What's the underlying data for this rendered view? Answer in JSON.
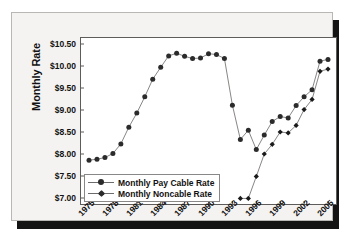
{
  "chart_data": {
    "type": "line",
    "title": "",
    "xlabel": "",
    "ylabel": "Monthly Rate",
    "xlim": [
      1975,
      2005
    ],
    "ylim": [
      7.0,
      10.5
    ],
    "ytick_labels": [
      "$10.50",
      "$10.00",
      "$9.50",
      "$9.00",
      "$8.50",
      "$8.00",
      "$7.50",
      "$7.00"
    ],
    "ytick_values": [
      10.5,
      10.0,
      9.5,
      9.0,
      8.5,
      8.0,
      7.5,
      7.0
    ],
    "xtick_labels": [
      "1975",
      "1978",
      "1981",
      "1984",
      "1987",
      "1990",
      "1993",
      "1996",
      "1999",
      "2002",
      "2005"
    ],
    "xtick_values": [
      1975,
      1978,
      1981,
      1984,
      1987,
      1990,
      1993,
      1996,
      1999,
      2002,
      2005
    ],
    "grid": false,
    "legend_position": "lower-left",
    "x": [
      1975,
      1976,
      1977,
      1978,
      1979,
      1980,
      1981,
      1982,
      1983,
      1984,
      1985,
      1986,
      1987,
      1988,
      1989,
      1990,
      1991,
      1992,
      1993,
      1994,
      1995,
      1996,
      1997,
      1998,
      1999,
      2000,
      2001,
      2002,
      2003,
      2004,
      2005
    ],
    "series": [
      {
        "name": "Monthly Pay Cable Rate",
        "marker": "circle",
        "color": "#2b2b2b",
        "x": [
          1975,
          1976,
          1977,
          1978,
          1979,
          1980,
          1981,
          1982,
          1983,
          1984,
          1985,
          1986,
          1987,
          1988,
          1989,
          1990,
          1991,
          1992,
          1993,
          1994,
          1995,
          1996,
          1997,
          1998,
          1999,
          2000,
          2001,
          2002,
          2003,
          2004,
          2005
        ],
        "values": [
          7.86,
          7.88,
          7.92,
          8.01,
          8.23,
          8.61,
          8.93,
          9.3,
          9.7,
          9.97,
          10.23,
          10.29,
          10.22,
          10.17,
          10.18,
          10.28,
          10.26,
          10.17,
          9.11,
          8.33,
          8.54,
          8.1,
          8.43,
          8.74,
          8.85,
          8.82,
          9.1,
          9.3,
          9.46,
          10.11,
          10.15
        ]
      },
      {
        "name": "Monthly Noncable Rate",
        "marker": "diamond",
        "color": "#1a1a1a",
        "x": [
          1994,
          1995,
          1996,
          1997,
          1998,
          1999,
          2000,
          2001,
          2002,
          2003,
          2004,
          2005
        ],
        "values": [
          6.99,
          6.99,
          7.49,
          8.0,
          8.22,
          8.5,
          8.48,
          8.65,
          9.01,
          9.24,
          9.88,
          9.93
        ]
      }
    ]
  },
  "axis": {
    "y_title": "Monthly Rate"
  },
  "legend": {
    "items": [
      {
        "label": "Monthly Pay Cable Rate",
        "marker": "circle-marker"
      },
      {
        "label": "Monthly Noncable Rate",
        "marker": "diamond-marker"
      }
    ]
  }
}
